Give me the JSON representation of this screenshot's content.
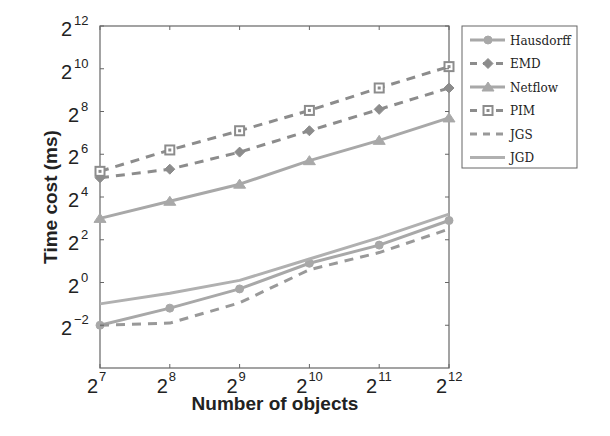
{
  "chart_data": {
    "type": "line",
    "title": "",
    "xlabel": "Number of objects",
    "ylabel": "Time cost (ms)",
    "x_scale": "log2",
    "y_scale": "log2",
    "x": [
      7,
      8,
      9,
      10,
      11,
      12
    ],
    "x_tick_labels": [
      "2^7",
      "2^8",
      "2^9",
      "2^10",
      "2^11",
      "2^12"
    ],
    "y_ticks": [
      -2,
      0,
      2,
      4,
      6,
      8,
      10,
      12
    ],
    "y_tick_labels": [
      "2^-2",
      "2^0",
      "2^2",
      "2^4",
      "2^6",
      "2^8",
      "2^10",
      "2^12"
    ],
    "xlim": [
      7,
      12
    ],
    "ylim": [
      -4,
      12
    ],
    "grid": false,
    "legend_position": "outside-right-top",
    "series": [
      {
        "name": "Hausdorff",
        "values_log2": [
          -2.0,
          -1.2,
          -0.3,
          0.9,
          1.75,
          2.9
        ],
        "style": "solid",
        "marker": "circle",
        "color": "#a8a8a8"
      },
      {
        "name": "EMD",
        "values_log2": [
          4.9,
          5.3,
          6.1,
          7.1,
          8.1,
          9.1
        ],
        "style": "dashed",
        "marker": "diamond",
        "color": "#8c8c8c"
      },
      {
        "name": "Netflow",
        "values_log2": [
          3.0,
          3.8,
          4.6,
          5.7,
          6.65,
          7.7
        ],
        "style": "solid",
        "marker": "triangle",
        "color": "#a8a8a8"
      },
      {
        "name": "PIM",
        "values_log2": [
          5.2,
          6.2,
          7.1,
          8.05,
          9.1,
          10.1
        ],
        "style": "dashed",
        "marker": "square",
        "color": "#8c8c8c"
      },
      {
        "name": "JGS",
        "values_log2": [
          -2.0,
          -1.9,
          -0.95,
          0.6,
          1.4,
          2.5
        ],
        "style": "dashed",
        "marker": "none",
        "color": "#999999"
      },
      {
        "name": "JGD",
        "values_log2": [
          -1.0,
          -0.5,
          0.1,
          1.1,
          2.1,
          3.2
        ],
        "style": "solid",
        "marker": "none",
        "color": "#b0b0b0"
      }
    ]
  },
  "legend": {
    "items": [
      "Hausdorff",
      "EMD",
      "Netflow",
      "PIM",
      "JGS",
      "JGD"
    ]
  }
}
